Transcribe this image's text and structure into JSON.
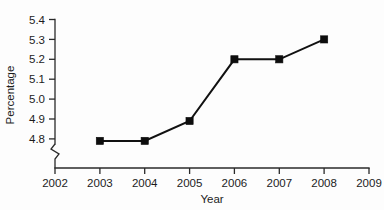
{
  "chart_data": {
    "type": "line",
    "title": "",
    "subtitle": "",
    "xlabel": "Year",
    "ylabel": "Percentage",
    "x": [
      2003,
      2004,
      2005,
      2006,
      2007,
      2008
    ],
    "values": [
      4.79,
      4.79,
      4.89,
      5.2,
      5.2,
      5.3
    ],
    "series": [
      {
        "name": "Percentage",
        "values": [
          4.79,
          4.79,
          4.89,
          5.2,
          5.2,
          5.3
        ]
      }
    ],
    "xticks": [
      2002,
      2003,
      2004,
      2005,
      2006,
      2007,
      2008,
      2009
    ],
    "xtick_labels": [
      "2002",
      "2003",
      "2004",
      "2005",
      "2006",
      "2007",
      "2008",
      "2009"
    ],
    "yticks": [
      4.8,
      4.9,
      5.0,
      5.1,
      5.2,
      5.3,
      5.4
    ],
    "ytick_labels": [
      "4.8",
      "4.9",
      "5.0",
      "5.1",
      "5.2",
      "5.3",
      "5.4"
    ],
    "xlim": [
      2002,
      2009
    ],
    "ylim": [
      4.8,
      5.4
    ],
    "grid": false,
    "legend": false,
    "legend_position": "none",
    "y_axis_break": true,
    "marker": "square",
    "marker_color": "#0d0d0d",
    "line_color": "#111111",
    "background_color": "#ffffff"
  },
  "axes": {
    "x_title": "Year",
    "y_title": "Percentage"
  },
  "ticks": {
    "y": [
      {
        "label": "5.4"
      },
      {
        "label": "5.3"
      },
      {
        "label": "5.2"
      },
      {
        "label": "5.1"
      },
      {
        "label": "5.0"
      },
      {
        "label": "4.9"
      },
      {
        "label": "4.8"
      }
    ],
    "x": [
      {
        "label": "2002"
      },
      {
        "label": "2003"
      },
      {
        "label": "2004"
      },
      {
        "label": "2005"
      },
      {
        "label": "2006"
      },
      {
        "label": "2007"
      },
      {
        "label": "2008"
      },
      {
        "label": "2009"
      }
    ]
  }
}
